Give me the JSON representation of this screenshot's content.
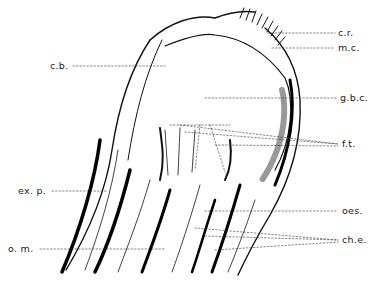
{
  "figure": {
    "type": "anatomical line drawing",
    "labels": [
      {
        "id": "cr",
        "text": "c.r.",
        "x": 338,
        "y": 27
      },
      {
        "id": "mc",
        "text": "m.c.",
        "x": 338,
        "y": 42
      },
      {
        "id": "cb",
        "text": "c.b.",
        "x": 50,
        "y": 60
      },
      {
        "id": "gbc",
        "text": "g.b.c.",
        "x": 340,
        "y": 92
      },
      {
        "id": "ft",
        "text": "f.t.",
        "x": 342,
        "y": 138
      },
      {
        "id": "exp",
        "text": "ex. p.",
        "x": 18,
        "y": 185
      },
      {
        "id": "oes",
        "text": "oes.",
        "x": 342,
        "y": 205
      },
      {
        "id": "che",
        "text": "ch.e.",
        "x": 342,
        "y": 234
      },
      {
        "id": "om",
        "text": "o. m.",
        "x": 8,
        "y": 243
      }
    ]
  }
}
